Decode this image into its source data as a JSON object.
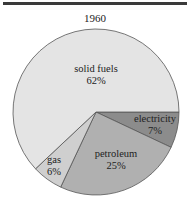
{
  "chart_data": {
    "type": "pie",
    "title": "1960",
    "slices": [
      {
        "label": "electricity",
        "value": 7,
        "display": "7%",
        "color": "#8c8c8c"
      },
      {
        "label": "petroleum",
        "value": 25,
        "display": "25%",
        "color": "#b0b0b0"
      },
      {
        "label": "gas",
        "value": 6,
        "display": "6%",
        "color": "#cfcfcf"
      },
      {
        "label": "solid fuels",
        "value": 62,
        "display": "62%",
        "color": "#e4e4e4"
      }
    ],
    "units": "%",
    "legend": "none (labels inside slices)"
  },
  "labels": {
    "electricity": {
      "name": "electricity",
      "pct": "7%"
    },
    "petroleum": {
      "name": "petroleum",
      "pct": "25%"
    },
    "gas": {
      "name": "gas",
      "pct": "6%"
    },
    "solid_fuels": {
      "name": "solid fuels",
      "pct": "62%"
    }
  }
}
